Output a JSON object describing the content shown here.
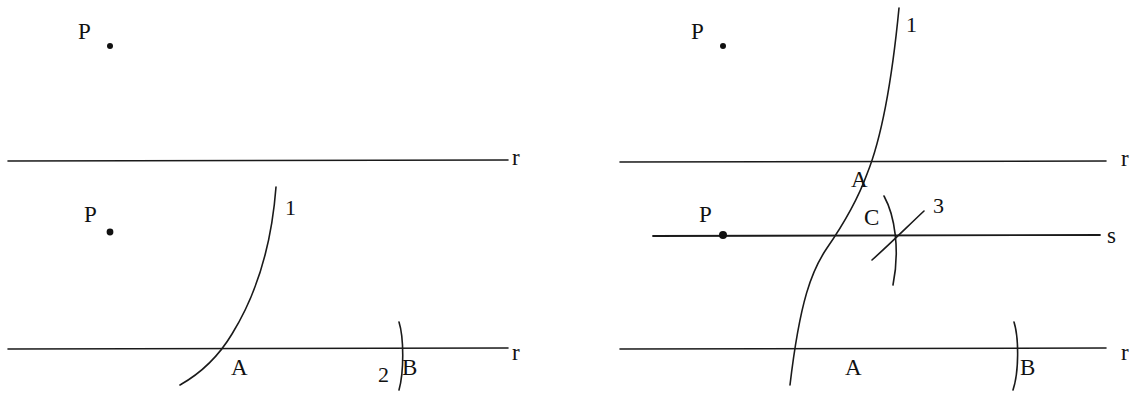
{
  "figure": {
    "width": 1142,
    "height": 407,
    "background_color": "#ffffff",
    "ink_color": "#1a1a1a"
  },
  "panels": [
    {
      "id": "panel-left",
      "caption": "Step 1: draw arc 1 centered at P cutting line r at A, then arc 2 of the same radius centered at A cutting r at B",
      "labels": {
        "point_p_top": "P",
        "line_r_top": "r",
        "point_p_bottom": "P",
        "arc_1": "1",
        "point_a": "A",
        "arc_2": "2",
        "point_b": "B",
        "line_r_bottom": "r"
      }
    },
    {
      "id": "panel-right",
      "caption": "Step 2: arc 3 centered at P meets arc 1 at C; line s through P and C is parallel to r",
      "labels": {
        "point_p_top": "P",
        "arc_1": "1",
        "line_r_top": "r",
        "point_a_top": "A",
        "point_p_on_s": "P",
        "point_c": "C",
        "arc_3": "3",
        "line_s": "s",
        "point_a_bottom": "A",
        "point_b": "B",
        "line_r_bottom": "r"
      }
    }
  ],
  "geometry": {
    "left": {
      "line_r_top": {
        "x1": 8,
        "y1": 161,
        "x2": 508,
        "y2": 160
      },
      "line_r_bottom": {
        "x1": 8,
        "y1": 349,
        "x2": 508,
        "y2": 348
      },
      "point_p_top": {
        "cx": 110,
        "cy": 46,
        "r": 3
      },
      "point_p_bottom": {
        "cx": 110,
        "cy": 232,
        "r": 3.4
      },
      "arc_1_path": "M 276 187 C 272 240 258 292 232 334 C 220 354 203 372 180 385",
      "arc_2_path": "M 399 322 C 404 338 404 372 399 390"
    },
    "right": {
      "line_r_top": {
        "x1": 620,
        "y1": 162,
        "x2": 1106,
        "y2": 161
      },
      "line_s": {
        "x1": 653,
        "y1": 236,
        "x2": 1100,
        "y2": 235
      },
      "line_r_bottom": {
        "x1": 620,
        "y1": 349,
        "x2": 1106,
        "y2": 348
      },
      "point_p_top": {
        "cx": 723,
        "cy": 46,
        "r": 3
      },
      "point_p_on_s": {
        "cx": 723,
        "cy": 235,
        "r": 4
      },
      "point_c": {
        "cx": 896,
        "cy": 235,
        "r": 0
      },
      "arc_1_path": "M 899 8 C 893 70 884 132 867 174 C 859 196 845 222 827 248 C 812 270 800 300 790 385",
      "arc_3_path": "M 872 260 C 890 244 908 226 924 211",
      "arc_b_path": "M 1014 322 C 1019 338 1019 372 1013 390"
    }
  },
  "label_positions": {
    "left": {
      "p_top": {
        "x": 78,
        "y": 20
      },
      "r_top": {
        "x": 512,
        "y": 146
      },
      "p_bottom": {
        "x": 84,
        "y": 203
      },
      "one": {
        "x": 285,
        "y": 196
      },
      "a": {
        "x": 231,
        "y": 356
      },
      "two": {
        "x": 378,
        "y": 363
      },
      "b": {
        "x": 402,
        "y": 356
      },
      "r_bottom": {
        "x": 512,
        "y": 341
      }
    },
    "right": {
      "p_top": {
        "x": 691,
        "y": 20
      },
      "one": {
        "x": 906,
        "y": 13
      },
      "r_top": {
        "x": 1121,
        "y": 147
      },
      "a_top": {
        "x": 851,
        "y": 168
      },
      "p_on_s": {
        "x": 699,
        "y": 203
      },
      "c": {
        "x": 864,
        "y": 206
      },
      "three": {
        "x": 933,
        "y": 194
      },
      "s": {
        "x": 1107,
        "y": 224
      },
      "a_bottom": {
        "x": 845,
        "y": 356
      },
      "b": {
        "x": 1020,
        "y": 356
      },
      "r_bottom": {
        "x": 1121,
        "y": 341
      }
    }
  }
}
